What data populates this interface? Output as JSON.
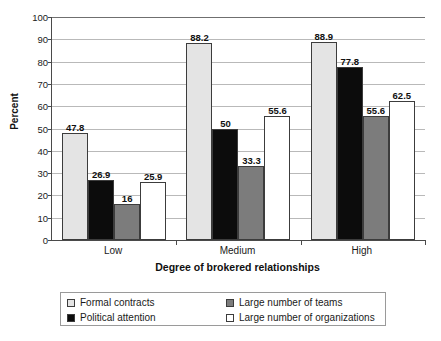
{
  "chart_data": {
    "type": "bar",
    "title": "",
    "subtitle": "",
    "xlabel": "Degree of brokered relationships",
    "ylabel": "Percent",
    "categories": [
      "Low",
      "Medium",
      "High"
    ],
    "series": [
      {
        "name": "Formal contracts",
        "color": "#e4e4e4",
        "values": [
          47.8,
          88.2,
          88.9
        ],
        "labels": [
          "47.8",
          "88.2",
          "88.9"
        ]
      },
      {
        "name": "Political attention",
        "color": "#0c0c0c",
        "values": [
          26.9,
          50,
          77.8
        ],
        "labels": [
          "26.9",
          "50",
          "77.8"
        ]
      },
      {
        "name": "Large number of teams",
        "color": "#7c7c7c",
        "values": [
          16,
          33.3,
          55.6
        ],
        "labels": [
          "16",
          "33.3",
          "55.6"
        ]
      },
      {
        "name": "Large number of organizations",
        "color": "#ffffff",
        "values": [
          25.9,
          55.6,
          62.5
        ],
        "labels": [
          "25.9",
          "55.6",
          "62.5"
        ]
      }
    ],
    "ylim": [
      0,
      100
    ],
    "ytick_values": [
      0,
      10,
      20,
      30,
      40,
      50,
      60,
      70,
      80,
      90,
      100
    ],
    "ytick_labels": [
      "0",
      "10",
      "20",
      "30",
      "40",
      "50",
      "60",
      "70",
      "80",
      "90",
      "100"
    ],
    "grid": true,
    "grid_axis": "y",
    "legend_position": "bottom",
    "data_labels": true
  },
  "legend": {
    "columns": [
      [
        {
          "label": "Formal contracts",
          "swatch": "s0"
        },
        {
          "label": "Political attention",
          "swatch": "s1"
        }
      ],
      [
        {
          "label": "Large number of teams",
          "swatch": "s2"
        },
        {
          "label": "Large number of organizations",
          "swatch": "s3"
        }
      ]
    ]
  }
}
